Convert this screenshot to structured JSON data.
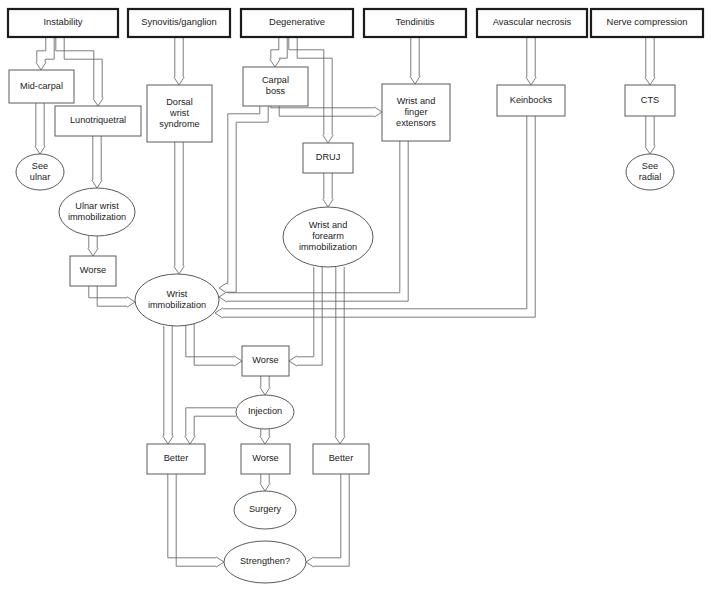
{
  "diagram": {
    "canvas": {
      "width": 712,
      "height": 591
    },
    "colors": {
      "background": "#ffffff",
      "node_fill": "#ffffff",
      "node_stroke": "#5a5a5a",
      "header_stroke": "#1b1b1b",
      "edge_stroke": "#6e6e6e",
      "text": "#1b1b1b"
    },
    "headers": [
      {
        "id": "instability",
        "label": "Instability",
        "x": 8,
        "y": 9,
        "w": 110,
        "h": 28
      },
      {
        "id": "synovitis",
        "label": "Synovitis/ganglion",
        "x": 128,
        "y": 9,
        "w": 102,
        "h": 28
      },
      {
        "id": "degenerative",
        "label": "Degenerative",
        "x": 241,
        "y": 9,
        "w": 112,
        "h": 28
      },
      {
        "id": "tendinitis",
        "label": "Tendinitis",
        "x": 364,
        "y": 9,
        "w": 102,
        "h": 28
      },
      {
        "id": "avascular",
        "label": "Avascular necrosis",
        "x": 477,
        "y": 9,
        "w": 110,
        "h": 28
      },
      {
        "id": "nerve",
        "label": "Nerve compression",
        "x": 591,
        "y": 9,
        "w": 112,
        "h": 28
      }
    ],
    "boxes": [
      {
        "id": "midcarpal",
        "label": "Mid-carpal",
        "x": 9,
        "y": 70,
        "w": 65,
        "h": 33
      },
      {
        "id": "lunotriquetral",
        "label": "Lunotriquetral",
        "x": 55,
        "y": 106,
        "w": 86,
        "h": 30
      },
      {
        "id": "worse-ulnar",
        "label": "Worse",
        "x": 70,
        "y": 256,
        "w": 46,
        "h": 30
      },
      {
        "id": "dorsal-wrist",
        "label": "Dorsal\nwrist\nsyndrome",
        "x": 147,
        "y": 85,
        "w": 65,
        "h": 57
      },
      {
        "id": "carpal-boss",
        "label": "Carpal\nboss",
        "x": 243,
        "y": 67,
        "w": 65,
        "h": 39
      },
      {
        "id": "druj",
        "label": "DRUJ",
        "x": 303,
        "y": 143,
        "w": 50,
        "h": 30
      },
      {
        "id": "extensors",
        "label": "Wrist and\nfinger\nextensors",
        "x": 382,
        "y": 84,
        "w": 68,
        "h": 57
      },
      {
        "id": "keinbocks",
        "label": "Keinbocks",
        "x": 497,
        "y": 85,
        "w": 68,
        "h": 31
      },
      {
        "id": "cts",
        "label": "CTS",
        "x": 625,
        "y": 85,
        "w": 50,
        "h": 31
      },
      {
        "id": "worse-mid",
        "label": "Worse",
        "x": 242,
        "y": 346,
        "w": 47,
        "h": 30
      },
      {
        "id": "better-left",
        "label": "Better",
        "x": 147,
        "y": 444,
        "w": 58,
        "h": 30
      },
      {
        "id": "worse-bottom",
        "label": "Worse",
        "x": 241,
        "y": 444,
        "w": 49,
        "h": 30
      },
      {
        "id": "better-right",
        "label": "Better",
        "x": 313,
        "y": 444,
        "w": 56,
        "h": 30
      }
    ],
    "ellipses": [
      {
        "id": "see-ulnar",
        "label": "See\nulnar",
        "cx": 40,
        "cy": 172,
        "rx": 24,
        "ry": 18
      },
      {
        "id": "ulnar-immob",
        "label": "Ulnar wrist\nimmobilization",
        "cx": 97,
        "cy": 212,
        "rx": 38,
        "ry": 24
      },
      {
        "id": "wrist-immob",
        "label": "Wrist\nimmobilization",
        "cx": 177,
        "cy": 300,
        "rx": 42,
        "ry": 26
      },
      {
        "id": "wrist-forearm-immob",
        "label": "Wrist and\nforearm\nimmobilization",
        "cx": 328,
        "cy": 237,
        "rx": 45,
        "ry": 30
      },
      {
        "id": "injection",
        "label": "Injection",
        "cx": 265,
        "cy": 412,
        "rx": 29,
        "ry": 17
      },
      {
        "id": "surgery",
        "label": "Surgery",
        "cx": 265,
        "cy": 510,
        "rx": 31,
        "ry": 19
      },
      {
        "id": "strengthen",
        "label": "Strengthen?",
        "cx": 265,
        "cy": 562,
        "rx": 41,
        "ry": 21
      },
      {
        "id": "see-radial",
        "label": "See\nradial",
        "cx": 650,
        "cy": 172,
        "rx": 24,
        "ry": 18
      }
    ],
    "edges": [
      {
        "from": "instability",
        "to": "midcarpal"
      },
      {
        "from": "instability",
        "to": "lunotriquetral"
      },
      {
        "from": "midcarpal",
        "to": "see-ulnar"
      },
      {
        "from": "lunotriquetral",
        "to": "ulnar-immob"
      },
      {
        "from": "ulnar-immob",
        "to": "worse-ulnar"
      },
      {
        "from": "worse-ulnar",
        "to": "wrist-immob"
      },
      {
        "from": "synovitis",
        "to": "dorsal-wrist"
      },
      {
        "from": "dorsal-wrist",
        "to": "wrist-immob"
      },
      {
        "from": "degenerative",
        "to": "carpal-boss"
      },
      {
        "from": "degenerative",
        "to": "druj"
      },
      {
        "from": "carpal-boss",
        "to": "extensors"
      },
      {
        "from": "carpal-boss",
        "to": "wrist-immob"
      },
      {
        "from": "druj",
        "to": "wrist-forearm-immob"
      },
      {
        "from": "tendinitis",
        "to": "extensors"
      },
      {
        "from": "extensors",
        "to": "wrist-immob"
      },
      {
        "from": "avascular",
        "to": "keinbocks"
      },
      {
        "from": "keinbocks",
        "to": "wrist-immob"
      },
      {
        "from": "nerve",
        "to": "cts"
      },
      {
        "from": "cts",
        "to": "see-radial"
      },
      {
        "from": "wrist-immob",
        "to": "better-left"
      },
      {
        "from": "wrist-immob",
        "to": "worse-mid"
      },
      {
        "from": "wrist-forearm-immob",
        "to": "worse-mid"
      },
      {
        "from": "wrist-forearm-immob",
        "to": "better-right"
      },
      {
        "from": "worse-mid",
        "to": "injection"
      },
      {
        "from": "injection",
        "to": "better-left"
      },
      {
        "from": "injection",
        "to": "worse-bottom"
      },
      {
        "from": "worse-bottom",
        "to": "surgery"
      },
      {
        "from": "better-left",
        "to": "strengthen"
      },
      {
        "from": "better-right",
        "to": "strengthen"
      }
    ]
  }
}
